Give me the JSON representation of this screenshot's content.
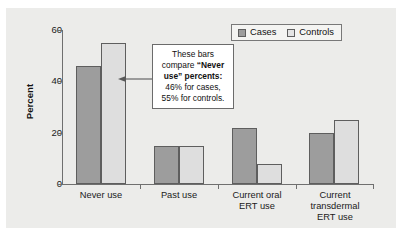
{
  "chart_data": {
    "type": "bar",
    "title": "",
    "subtitle": "",
    "xlabel": "",
    "ylabel": "Percent",
    "ylim": [
      0,
      60
    ],
    "yticks": [
      0,
      20,
      40,
      60
    ],
    "grid": false,
    "legend_position": "top-right",
    "categories": [
      "Never use",
      "Past use",
      "Current oral ERT use",
      "Current transdermal ERT use"
    ],
    "category_lines": [
      [
        "Never use"
      ],
      [
        "Past use"
      ],
      [
        "Current oral",
        "ERT use"
      ],
      [
        "Current",
        "transdermal",
        "ERT use"
      ]
    ],
    "series": [
      {
        "name": "Cases",
        "color": "#9d9d9d",
        "values": [
          46,
          15,
          22,
          20
        ]
      },
      {
        "name": "Controls",
        "color": "#dedede",
        "values": [
          55,
          15,
          8,
          25
        ]
      }
    ],
    "annotations": [
      {
        "name": "never-use-callout",
        "lines": [
          {
            "text": "These bars",
            "bold": false
          },
          {
            "text": "compare “Never",
            "bold_part": "“Never"
          },
          {
            "text": "use” percents:",
            "bold": true
          },
          {
            "text": "46% for cases,",
            "bold": false
          },
          {
            "text": "55% for controls.",
            "bold": false
          }
        ],
        "points_to": "Never use cases bar"
      }
    ]
  },
  "callout": {
    "line1": "These bars",
    "line2_plain": "compare ",
    "line2_bold": "“Never",
    "line3_bold": "use” percents:",
    "line4": "46% for cases,",
    "line5": "55% for controls."
  },
  "axis": {
    "y_label": "Percent",
    "y_tick_0": "0",
    "y_tick_1": "20",
    "y_tick_2": "40",
    "y_tick_3": "60"
  },
  "legend": {
    "item0": "Cases",
    "item1": "Controls"
  },
  "categories": {
    "c0_l0": "Never use",
    "c1_l0": "Past use",
    "c2_l0": "Current oral",
    "c2_l1": "ERT use",
    "c3_l0": "Current",
    "c3_l1": "transdermal",
    "c3_l2": "ERT use"
  }
}
